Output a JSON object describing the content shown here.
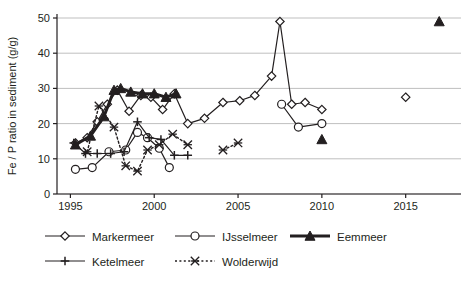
{
  "chart_data": {
    "type": "line",
    "title": "",
    "xlabel": "",
    "ylabel": "Fe / P ratio in sediment (g/g)",
    "xlim": [
      1994.2,
      2018.3
    ],
    "ylim": [
      0,
      50
    ],
    "xticks": [
      "1995",
      "2000",
      "2005",
      "2010",
      "2015"
    ],
    "yticks": [
      "0",
      "10",
      "20",
      "30",
      "40",
      "50"
    ],
    "grid": "horizontal",
    "legend_position": "bottom",
    "series": [
      {
        "name": "Markermeer",
        "marker": "open-diamond",
        "line": "solid-thin",
        "points": [
          {
            "x": 1995.3,
            "y": 14.5
          },
          {
            "x": 1996.0,
            "y": 16.0
          },
          {
            "x": 1996.6,
            "y": 20.5
          },
          {
            "x": 1997.2,
            "y": 25.5
          },
          {
            "x": 1997.8,
            "y": 29.5
          },
          {
            "x": 1998.5,
            "y": 23.5
          },
          {
            "x": 1999.2,
            "y": 28.0
          },
          {
            "x": 1999.8,
            "y": 27.5
          },
          {
            "x": 2000.5,
            "y": 24.0
          },
          {
            "x": 2001.2,
            "y": 28.5
          },
          {
            "x": 2002.0,
            "y": 20.0
          },
          {
            "x": 2003.0,
            "y": 21.5
          },
          {
            "x": 2004.1,
            "y": 26.0
          },
          {
            "x": 2005.1,
            "y": 26.5
          },
          {
            "x": 2006.0,
            "y": 28.0
          },
          {
            "x": 2007.0,
            "y": 33.5
          },
          {
            "x": 2007.5,
            "y": 49.0
          },
          {
            "x": 2008.2,
            "y": 25.5
          },
          {
            "x": 2009.0,
            "y": 26.0
          },
          {
            "x": 2010.0,
            "y": 24.0
          },
          {
            "x": 2015.0,
            "y": 27.5
          }
        ]
      },
      {
        "name": "IJsselmeer",
        "marker": "open-circle",
        "line": "solid-thin",
        "points": [
          {
            "x": 1995.3,
            "y": 7.0
          },
          {
            "x": 1996.3,
            "y": 7.5
          },
          {
            "x": 1997.3,
            "y": 12.0
          },
          {
            "x": 1998.3,
            "y": 12.5
          },
          {
            "x": 1999.0,
            "y": 17.5
          },
          {
            "x": 1999.6,
            "y": 16.0
          },
          {
            "x": 2000.3,
            "y": 13.0
          },
          {
            "x": 2000.9,
            "y": 7.5
          },
          {
            "x": 2007.6,
            "y": 25.5
          },
          {
            "x": 2008.6,
            "y": 19.0
          },
          {
            "x": 2010.0,
            "y": 20.0
          }
        ]
      },
      {
        "name": "Eemmeer",
        "marker": "filled-triangle",
        "line": "solid-thick",
        "points": [
          {
            "x": 1995.3,
            "y": 14.0
          },
          {
            "x": 1996.2,
            "y": 16.5
          },
          {
            "x": 1997.0,
            "y": 22.0
          },
          {
            "x": 1997.6,
            "y": 29.5
          },
          {
            "x": 1998.0,
            "y": 30.0
          },
          {
            "x": 1998.6,
            "y": 29.0
          },
          {
            "x": 1999.3,
            "y": 28.5
          },
          {
            "x": 2000.0,
            "y": 28.5
          },
          {
            "x": 2000.7,
            "y": 27.5
          },
          {
            "x": 2001.3,
            "y": 28.5
          },
          {
            "x": 2010.0,
            "y": 15.5
          },
          {
            "x": 2017.0,
            "y": 49.0
          }
        ]
      },
      {
        "name": "Ketelmeer",
        "marker": "plus-cross",
        "line": "solid-thin",
        "points": [
          {
            "x": 1995.2,
            "y": 14.5
          },
          {
            "x": 1995.9,
            "y": 11.5
          },
          {
            "x": 1996.6,
            "y": 11.5
          },
          {
            "x": 1997.4,
            "y": 11.5
          },
          {
            "x": 1998.2,
            "y": 12.0
          },
          {
            "x": 1999.0,
            "y": 20.5
          },
          {
            "x": 1999.7,
            "y": 16.0
          },
          {
            "x": 2000.4,
            "y": 15.5
          },
          {
            "x": 2001.2,
            "y": 11.0
          },
          {
            "x": 2002.0,
            "y": 11.0
          }
        ]
      },
      {
        "name": "Wolderwijd",
        "marker": "star-cross",
        "line": "dotted",
        "points": [
          {
            "x": 1996.0,
            "y": 12.0
          },
          {
            "x": 1996.7,
            "y": 25.0
          },
          {
            "x": 1997.6,
            "y": 19.0
          },
          {
            "x": 1998.3,
            "y": 8.0
          },
          {
            "x": 1999.0,
            "y": 6.5
          },
          {
            "x": 1999.6,
            "y": 12.5
          },
          {
            "x": 2000.3,
            "y": 14.0
          },
          {
            "x": 2001.1,
            "y": 17.0
          },
          {
            "x": 2002.0,
            "y": 14.0
          },
          {
            "x": 2004.1,
            "y": 12.5
          },
          {
            "x": 2005.0,
            "y": 14.5
          }
        ]
      }
    ],
    "legend": [
      {
        "label": "Markermeer",
        "marker": "open-diamond",
        "line": "solid-thin"
      },
      {
        "label": "IJsselmeer",
        "marker": "open-circle",
        "line": "solid-thin"
      },
      {
        "label": "Eemmeer",
        "marker": "filled-triangle",
        "line": "solid-thick"
      },
      {
        "label": "Ketelmeer",
        "marker": "plus-cross",
        "line": "solid-thin"
      },
      {
        "label": "Wolderwijd",
        "marker": "star-cross",
        "line": "dotted"
      }
    ],
    "colors": {
      "ink": "#231f20",
      "grid": "#bfbfbf",
      "background": "#ffffff"
    }
  }
}
